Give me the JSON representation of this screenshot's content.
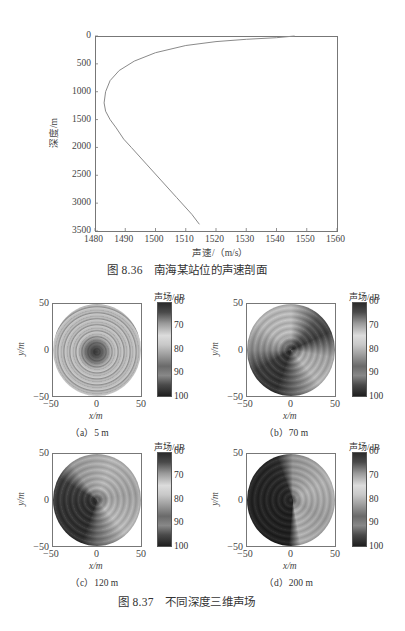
{
  "figure_836": {
    "caption": "图 8.36　南海某站位的声速剖面",
    "xlabel": "声速/（m/s）",
    "ylabel": "深度/m",
    "xticks": [
      "1480",
      "1490",
      "1500",
      "1510",
      "1520",
      "1530",
      "1540",
      "1550",
      "1560"
    ],
    "yticks": [
      "0",
      "500",
      "1000",
      "1500",
      "2000",
      "2500",
      "3000",
      "3500"
    ]
  },
  "figure_837": {
    "caption": "图 8.37　不同深度三维声场",
    "colorbar_title": "声场/dB",
    "colorbar_ticks": [
      "60",
      "70",
      "80",
      "90",
      "100"
    ],
    "xlabel": "x/m",
    "ylabel": "y/m",
    "xticks": [
      "−50",
      "0",
      "50"
    ],
    "yticks": [
      "50",
      "0",
      "−50"
    ],
    "panels": [
      {
        "label": "（a）5 m"
      },
      {
        "label": "（b）70 m"
      },
      {
        "label": "（c）120 m"
      },
      {
        "label": "（d）200 m"
      }
    ]
  },
  "chart_data": [
    {
      "type": "line",
      "title": "图 8.36 南海某站位的声速剖面",
      "xlabel": "声速/（m/s）",
      "ylabel": "深度/m",
      "xlim": [
        1480,
        1560
      ],
      "ylim": [
        3500,
        0
      ],
      "grid": false,
      "series": [
        {
          "name": "声速剖面",
          "x": [
            1546,
            1540,
            1530,
            1520,
            1510,
            1500,
            1493,
            1488,
            1485,
            1483.5,
            1483,
            1483.5,
            1485,
            1487,
            1489.5,
            1492,
            1497,
            1502,
            1507,
            1512,
            1514.5
          ],
          "y": [
            0,
            30,
            60,
            100,
            170,
            300,
            450,
            620,
            800,
            1000,
            1200,
            1350,
            1500,
            1650,
            1850,
            2000,
            2300,
            2600,
            2900,
            3200,
            3380
          ]
        }
      ]
    },
    {
      "type": "heatmap",
      "title": "图 8.37 不同深度三维声场",
      "xlabel": "x/m",
      "ylabel": "y/m",
      "xlim": [
        -50,
        50
      ],
      "ylim": [
        -50,
        50
      ],
      "colorbar": {
        "label": "声场/dB",
        "range": [
          60,
          100
        ],
        "ticks": [
          60,
          70,
          80,
          90,
          100
        ]
      },
      "panels": [
        {
          "label": "(a) 5 m",
          "description": "concentric rings, dark center"
        },
        {
          "label": "(b) 70 m",
          "description": "dark upper-left band and lower-right arc, dark center"
        },
        {
          "label": "(c) 120 m",
          "description": "dark left sector, light gray right area"
        },
        {
          "label": "(d) 200 m",
          "description": "large dark upper-left sector, gray spiral right"
        }
      ]
    }
  ]
}
